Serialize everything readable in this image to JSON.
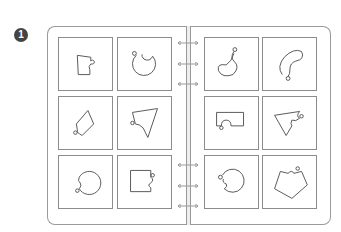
{
  "exercise": {
    "number": "1",
    "description": "Binder with two facing pages, each holding a 2x3 grid of shape-outline cards"
  },
  "binder": {
    "left_page": {
      "cards": [
        {
          "shape": "rectangle-with-notch",
          "label": "shape-1"
        },
        {
          "shape": "circle-with-notch",
          "label": "shape-2"
        },
        {
          "shape": "tilted-rectangle-with-notch",
          "label": "shape-3"
        },
        {
          "shape": "triangle-with-notch",
          "label": "shape-4"
        },
        {
          "shape": "circle-with-notch",
          "label": "shape-5"
        },
        {
          "shape": "square-with-notch",
          "label": "shape-6"
        }
      ]
    },
    "right_page": {
      "cards": [
        {
          "shape": "bean-blob",
          "label": "shape-7"
        },
        {
          "shape": "curved-blob",
          "label": "shape-8"
        },
        {
          "shape": "rectangle-with-notch",
          "label": "shape-9"
        },
        {
          "shape": "triangle-with-notch",
          "label": "shape-10"
        },
        {
          "shape": "circle-with-notch",
          "label": "shape-11"
        },
        {
          "shape": "pentagon-with-notch",
          "label": "shape-12"
        }
      ]
    },
    "rings_count": 6
  },
  "colors": {
    "line": "#8c8c8c",
    "badge": "#444444"
  }
}
